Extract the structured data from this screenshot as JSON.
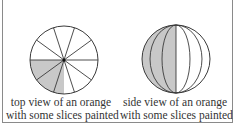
{
  "figure": {
    "panels": [
      {
        "id": "top-view",
        "caption_line1": "top view of an orange",
        "caption_line2": "with some slices painted",
        "slices": 10,
        "painted_region": "lower-left quarter"
      },
      {
        "id": "side-view",
        "caption_line1": "side view of an orange",
        "caption_line2": "with some slices painted",
        "painted_region": "left half"
      }
    ],
    "colors": {
      "stroke": "#3a3a3a",
      "paint": "#c8c8c8",
      "frame": "#8a8a8a"
    },
    "cut_off_text": "..."
  }
}
